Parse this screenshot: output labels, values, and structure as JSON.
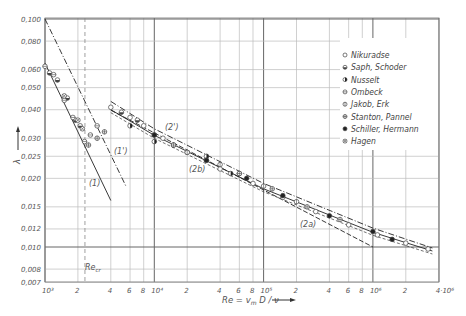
{
  "chart_data": {
    "type": "scatter",
    "title": "",
    "xlabel": "Re = v_m D / ν",
    "ylabel": "λ",
    "xscale": "log",
    "yscale": "log",
    "xlim": [
      1000,
      4000000
    ],
    "ylim": [
      0.007,
      0.1
    ],
    "grid": true,
    "legend_position": "upper right",
    "x_ticks": [
      {
        "value": 1000,
        "label": "10³"
      },
      {
        "value": 2000,
        "label": "2"
      },
      {
        "value": 4000,
        "label": "4"
      },
      {
        "value": 6000,
        "label": "6"
      },
      {
        "value": 8000,
        "label": "8"
      },
      {
        "value": 10000,
        "label": "10⁴"
      },
      {
        "value": 20000,
        "label": "2"
      },
      {
        "value": 40000,
        "label": "4"
      },
      {
        "value": 60000,
        "label": "6"
      },
      {
        "value": 80000,
        "label": "8"
      },
      {
        "value": 100000,
        "label": "10⁵"
      },
      {
        "value": 200000,
        "label": "2"
      },
      {
        "value": 400000,
        "label": "4"
      },
      {
        "value": 600000,
        "label": "6"
      },
      {
        "value": 800000,
        "label": "8"
      },
      {
        "value": 1000000,
        "label": "10⁶"
      },
      {
        "value": 2000000,
        "label": "2"
      },
      {
        "value": 4000000,
        "label": "4·10⁶"
      }
    ],
    "y_ticks": [
      {
        "value": 0.1,
        "label": "0,100"
      },
      {
        "value": 0.08,
        "label": "0,080"
      },
      {
        "value": 0.06,
        "label": "0,060"
      },
      {
        "value": 0.05,
        "label": "0,050"
      },
      {
        "value": 0.04,
        "label": "0,040"
      },
      {
        "value": 0.03,
        "label": "0,030"
      },
      {
        "value": 0.025,
        "label": "0,025"
      },
      {
        "value": 0.02,
        "label": "0,020"
      },
      {
        "value": 0.015,
        "label": "0,015"
      },
      {
        "value": 0.012,
        "label": "0,012"
      },
      {
        "value": 0.01,
        "label": "0,010"
      },
      {
        "value": 0.008,
        "label": "0,008"
      },
      {
        "value": 0.007,
        "label": "0,007"
      }
    ],
    "annotations": [
      {
        "text": "Re_cr",
        "x": 2320,
        "y": 0.0078,
        "note": "critical Reynolds number, dashed vertical line"
      },
      {
        "text": "(1)",
        "x": 2900,
        "y": 0.0205
      },
      {
        "text": "(1')",
        "x": 5200,
        "y": 0.0275
      },
      {
        "text": "(2')",
        "x": 15000,
        "y": 0.0305
      },
      {
        "text": "(2b)",
        "x": 23000,
        "y": 0.0225
      },
      {
        "text": "(2a)",
        "x": 230000,
        "y": 0.0133
      }
    ],
    "lines": [
      {
        "name": "(1) laminar λ=64/Re",
        "style": "solid",
        "x": [
          1000,
          4000
        ],
        "y": [
          0.064,
          0.016
        ]
      },
      {
        "name": "(1')",
        "style": "dash-dot",
        "x": [
          1000,
          5500
        ],
        "y": [
          0.1,
          0.0185
        ]
      },
      {
        "name": "(2a) Blasius",
        "style": "dashed",
        "x": [
          4000,
          1000000
        ],
        "y": [
          0.0398,
          0.01
        ]
      },
      {
        "name": "(2b) Prandtl",
        "style": "solid",
        "x": [
          4000,
          10000,
          100000,
          1000000,
          3500000
        ],
        "y": [
          0.04,
          0.0309,
          0.018,
          0.0116,
          0.0096
        ]
      },
      {
        "name": "(2')",
        "style": "dash-dot",
        "x": [
          4000,
          10000,
          100000,
          1000000,
          3500000
        ],
        "y": [
          0.0435,
          0.033,
          0.019,
          0.0121,
          0.0099
        ]
      }
    ],
    "series": [
      {
        "name": "Nikuradse",
        "marker": "open-circle",
        "x": [
          4000,
          6000,
          8000,
          12000,
          20000,
          40000,
          80000,
          150000,
          300000,
          600000,
          1100000,
          2000000,
          3200000
        ],
        "y": [
          0.041,
          0.037,
          0.034,
          0.03,
          0.026,
          0.022,
          0.019,
          0.0165,
          0.0143,
          0.0125,
          0.0113,
          0.0104,
          0.0098
        ]
      },
      {
        "name": "Saph, Schoder",
        "marker": "half-filled-circle",
        "x": [
          1100,
          1300,
          1600,
          1900,
          2100,
          5000,
          7000,
          10000,
          15000
        ],
        "y": [
          0.058,
          0.054,
          0.045,
          0.036,
          0.034,
          0.039,
          0.036,
          0.031,
          0.028
        ]
      },
      {
        "name": "Nusselt",
        "marker": "right-half-filled-circle",
        "x": [
          6000,
          10000,
          30000,
          50000
        ],
        "y": [
          0.034,
          0.029,
          0.025,
          0.021
        ]
      },
      {
        "name": "Ombeck",
        "marker": "circle-horizontal-line",
        "x": [
          1000,
          1200,
          1500,
          1800,
          2300,
          2600,
          3000
        ],
        "y": [
          0.062,
          0.057,
          0.044,
          0.037,
          0.029,
          0.031,
          0.034
        ]
      },
      {
        "name": "Jakob, Erk",
        "marker": "circle-vertical-line",
        "x": [
          20000,
          40000,
          60000,
          100000,
          200000
        ],
        "y": [
          0.026,
          0.023,
          0.021,
          0.0185,
          0.0158
        ]
      },
      {
        "name": "Stanton, Pannel",
        "marker": "circle-cross-line",
        "x": [
          2500,
          3000,
          3500,
          15000,
          30000,
          60000,
          120000,
          250000,
          500000
        ],
        "y": [
          0.028,
          0.03,
          0.032,
          0.028,
          0.024,
          0.021,
          0.018,
          0.015,
          0.0132
        ]
      },
      {
        "name": "Schiller, Hermann",
        "marker": "filled-circle",
        "x": [
          10000,
          30000,
          70000,
          150000,
          400000,
          1000000,
          1500000
        ],
        "y": [
          0.031,
          0.024,
          0.02,
          0.0168,
          0.0137,
          0.0117,
          0.0108
        ]
      },
      {
        "name": "Hagen",
        "marker": "crossed-circle",
        "x": [
          1500,
          2000,
          2200
        ],
        "y": [
          0.046,
          0.036,
          0.033
        ]
      }
    ]
  },
  "legend": {
    "items": [
      {
        "label": "Nikuradse",
        "marker": "open-circle"
      },
      {
        "label": "Saph, Schoder",
        "marker": "half-filled-circle"
      },
      {
        "label": "Nusselt",
        "marker": "right-half-filled-circle"
      },
      {
        "label": "Ombeck",
        "marker": "circle-horizontal-line"
      },
      {
        "label": "Jakob, Erk",
        "marker": "circle-vertical-line"
      },
      {
        "label": "Stanton, Pannel",
        "marker": "circle-cross-line"
      },
      {
        "label": "Schiller, Hermann",
        "marker": "filled-circle"
      },
      {
        "label": "Hagen",
        "marker": "crossed-circle"
      }
    ]
  },
  "labels": {
    "y_axis": "λ",
    "x_axis": "Re = v",
    "x_axis_sub": "m",
    "x_axis_tail": " D / ν",
    "re_cr": "Re",
    "re_cr_sub": "cr",
    "curve_1": "(1)",
    "curve_1p": "(1')",
    "curve_2p": "(2')",
    "curve_2b": "(2b)",
    "curve_2a": "(2a)"
  }
}
